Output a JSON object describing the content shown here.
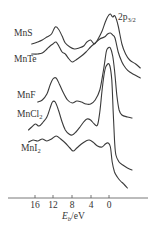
{
  "chart_data": {
    "type": "line",
    "title": "",
    "xlabel": "E_b/eV",
    "ylabel": "",
    "xlim": [
      20,
      -5
    ],
    "x_reversed": true,
    "grid": false,
    "legend": "inline labels at left of each curve",
    "annotation": "2p3/2",
    "x_ticks": [
      16,
      12,
      8,
      4,
      0
    ],
    "series": [
      {
        "name": "MnS",
        "label_parts": [
          "MnS",
          ""
        ],
        "label_pos": [
          14,
          36
        ],
        "points": [
          [
            16.8,
            44
          ],
          [
            15.5,
            42
          ],
          [
            14.5,
            40
          ],
          [
            13.5,
            37
          ],
          [
            12.5,
            34
          ],
          [
            11.7,
            27
          ],
          [
            11.0,
            29
          ],
          [
            10.2,
            36
          ],
          [
            9.5,
            43
          ],
          [
            8.5,
            47
          ],
          [
            7.5,
            49
          ],
          [
            6.5,
            48
          ],
          [
            5.5,
            46
          ],
          [
            4.8,
            42
          ],
          [
            4.0,
            40
          ],
          [
            3.2,
            44
          ],
          [
            2.5,
            40
          ],
          [
            1.5,
            31
          ],
          [
            0.8,
            22
          ],
          [
            0.2,
            16
          ],
          [
            -0.3,
            14
          ],
          [
            -0.8,
            17
          ],
          [
            -1.3,
            16
          ],
          [
            -2.0,
            26
          ],
          [
            -2.8,
            44
          ],
          [
            -3.6,
            54
          ],
          [
            -4.5,
            60
          ],
          [
            -5.8,
            64
          ],
          [
            -6.8,
            68
          ]
        ]
      },
      {
        "name": "MnTe",
        "label_parts": [
          "MnTe",
          ""
        ],
        "label_pos": [
          14,
          62
        ],
        "points": [
          [
            16.8,
            54
          ],
          [
            15.5,
            54
          ],
          [
            14.5,
            53
          ],
          [
            13.5,
            49
          ],
          [
            12.8,
            46
          ],
          [
            12.2,
            44
          ],
          [
            11.5,
            42
          ],
          [
            10.8,
            47
          ],
          [
            10.2,
            52
          ],
          [
            9.5,
            54
          ],
          [
            8.7,
            59
          ],
          [
            8.0,
            62
          ],
          [
            7.2,
            60
          ],
          [
            6.0,
            56
          ],
          [
            5.0,
            52
          ],
          [
            4.0,
            47
          ],
          [
            3.0,
            43
          ],
          [
            2.0,
            39
          ],
          [
            1.0,
            37
          ],
          [
            0.3,
            34
          ],
          [
            -0.3,
            33
          ],
          [
            -0.8,
            35
          ],
          [
            -1.3,
            38
          ],
          [
            -2.0,
            52
          ],
          [
            -2.8,
            62
          ],
          [
            -3.6,
            68
          ],
          [
            -4.5,
            72
          ],
          [
            -6.8,
            78
          ]
        ]
      },
      {
        "name": "MnF",
        "label_parts": [
          "MnF",
          ""
        ],
        "label_pos": [
          17,
          98
        ],
        "points": [
          [
            15.5,
            102
          ],
          [
            14.5,
            100
          ],
          [
            13.5,
            94
          ],
          [
            12.8,
            85
          ],
          [
            12.2,
            79
          ],
          [
            11.5,
            78
          ],
          [
            10.8,
            84
          ],
          [
            10.0,
            92
          ],
          [
            9.0,
            100
          ],
          [
            8.0,
            103
          ],
          [
            7.0,
            101
          ],
          [
            6.0,
            102
          ],
          [
            5.0,
            104
          ],
          [
            4.0,
            104
          ],
          [
            3.0,
            100
          ],
          [
            2.0,
            90
          ],
          [
            1.2,
            70
          ],
          [
            0.6,
            52
          ],
          [
            0.2,
            48
          ],
          [
            -0.3,
            48
          ],
          [
            -0.8,
            56
          ],
          [
            -1.2,
            70
          ],
          [
            -1.7,
            95
          ],
          [
            -2.2,
            110
          ],
          [
            -2.8,
            115
          ],
          [
            -4.0,
            117
          ],
          [
            -5.0,
            118
          ]
        ]
      },
      {
        "name": "MnCl2",
        "label_parts": [
          "MnCl",
          "2"
        ],
        "label_pos": [
          17,
          117
        ],
        "points": [
          [
            17.5,
            130
          ],
          [
            16.8,
            127
          ],
          [
            16.0,
            124
          ],
          [
            15.2,
            126
          ],
          [
            14.3,
            122
          ],
          [
            13.5,
            117
          ],
          [
            12.8,
            108
          ],
          [
            12.3,
            102
          ],
          [
            11.7,
            102
          ],
          [
            11.0,
            110
          ],
          [
            10.2,
            122
          ],
          [
            9.5,
            130
          ],
          [
            8.7,
            134
          ],
          [
            8.0,
            135
          ],
          [
            7.2,
            132
          ],
          [
            6.3,
            127
          ],
          [
            5.5,
            122
          ],
          [
            4.8,
            119
          ],
          [
            4.0,
            120
          ],
          [
            3.2,
            124
          ],
          [
            2.5,
            125
          ],
          [
            2.0,
            112
          ],
          [
            1.5,
            90
          ],
          [
            0.9,
            70
          ],
          [
            0.3,
            64
          ],
          [
            -0.2,
            66
          ],
          [
            -0.6,
            80
          ],
          [
            -0.9,
            110
          ],
          [
            -1.2,
            140
          ],
          [
            -1.5,
            155
          ],
          [
            -2.2,
            162
          ],
          [
            -3.0,
            165
          ],
          [
            -4.0,
            168
          ],
          [
            -5.0,
            170
          ]
        ]
      },
      {
        "name": "MnI2",
        "label_parts": [
          "MnI",
          "2"
        ],
        "label_pos": [
          21,
          151
        ],
        "points": [
          [
            17.5,
            142
          ],
          [
            16.5,
            140
          ],
          [
            15.5,
            141
          ],
          [
            14.5,
            139
          ],
          [
            13.5,
            141
          ],
          [
            12.5,
            139
          ],
          [
            11.5,
            136
          ],
          [
            10.5,
            139
          ],
          [
            9.5,
            143
          ],
          [
            8.5,
            148
          ],
          [
            7.8,
            151
          ],
          [
            7.0,
            148
          ],
          [
            6.0,
            144
          ],
          [
            5.0,
            141
          ],
          [
            4.3,
            140
          ],
          [
            3.5,
            142
          ],
          [
            2.5,
            146
          ],
          [
            1.5,
            147
          ],
          [
            0.8,
            144
          ],
          [
            0.2,
            143
          ],
          [
            -0.3,
            147
          ],
          [
            -0.7,
            162
          ],
          [
            -1.2,
            172
          ],
          [
            -1.8,
            177
          ],
          [
            -2.5,
            181
          ],
          [
            -3.2,
            184
          ],
          [
            -4.0,
            188
          ]
        ]
      }
    ]
  },
  "labels": {
    "annotation_main": "2p",
    "annotation_sub": "3/2",
    "x_axis_main": "E",
    "x_axis_sub": "b",
    "x_axis_unit": "/eV",
    "ticks": [
      "16",
      "12",
      "8",
      "4",
      "0"
    ]
  }
}
